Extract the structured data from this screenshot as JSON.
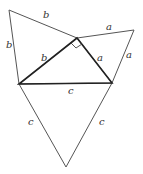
{
  "diagram": {
    "points": {
      "B_top": [
        9,
        10
      ],
      "R": [
        77,
        38
      ],
      "A_top": [
        134,
        30
      ],
      "L": [
        19,
        84
      ],
      "Rb": [
        112,
        83
      ],
      "C_bot": [
        66,
        167
      ]
    },
    "labels": [
      {
        "text": "b",
        "x": 43,
        "y": 18
      },
      {
        "text": "a",
        "x": 106,
        "y": 30
      },
      {
        "text": "b",
        "x": 6,
        "y": 48
      },
      {
        "text": "b",
        "x": 41,
        "y": 61
      },
      {
        "text": "a",
        "x": 97,
        "y": 61
      },
      {
        "text": "a",
        "x": 126,
        "y": 58
      },
      {
        "text": "c",
        "x": 68,
        "y": 94
      },
      {
        "text": "c",
        "x": 28,
        "y": 125
      },
      {
        "text": "c",
        "x": 99,
        "y": 125
      }
    ],
    "line_color": "#444444",
    "heavy_color": "#222222"
  }
}
